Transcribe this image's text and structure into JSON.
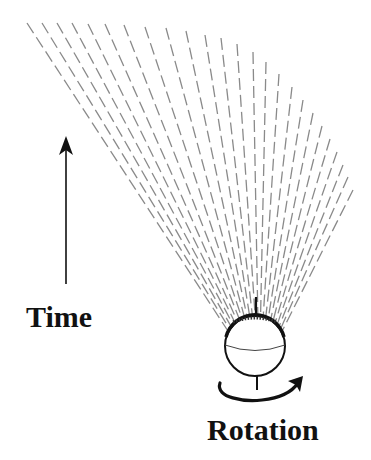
{
  "labels": {
    "time": "Time",
    "rotation": "Rotation"
  },
  "colors": {
    "rays": "#8a8a8a",
    "ink": "#111111",
    "background": "#ffffff"
  },
  "figure": {
    "sphere": {
      "cx": 255,
      "cy": 346,
      "r": 30
    },
    "time_arrow": {
      "x": 66,
      "y_bottom": 284,
      "y_top": 137
    },
    "rays": {
      "dash": "12 5",
      "top_points": [
        [
          27,
          23
        ],
        [
          42,
          23
        ],
        [
          57,
          23
        ],
        [
          72,
          23
        ],
        [
          88,
          24
        ],
        [
          105,
          24
        ],
        [
          124,
          25
        ],
        [
          145,
          27
        ],
        [
          166,
          28
        ],
        [
          186,
          31
        ],
        [
          205,
          35
        ],
        [
          221,
          38
        ],
        [
          237,
          44
        ],
        [
          253,
          52
        ],
        [
          266,
          62
        ],
        [
          279,
          74
        ],
        [
          292,
          87
        ],
        [
          303,
          100
        ],
        [
          313,
          113
        ],
        [
          322,
          126
        ],
        [
          330,
          139
        ],
        [
          337,
          152
        ],
        [
          343,
          165
        ],
        [
          348,
          177
        ],
        [
          353,
          190
        ]
      ],
      "base_arc": {
        "cx": 255,
        "cy": 346,
        "r": 32,
        "start_deg": 210,
        "end_deg": 330
      }
    }
  }
}
